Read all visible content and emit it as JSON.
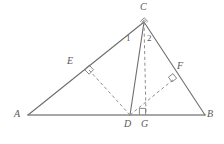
{
  "figure": {
    "kind": "geometry-diagram",
    "canvas": {
      "width": 224,
      "height": 144
    },
    "colors": {
      "stroke": "#6e6e6e",
      "baseline_stroke": "#8a8a8a",
      "dashed_stroke": "#8f8f8f",
      "label_text": "#595959",
      "background": "#ffffff"
    },
    "points": [
      {
        "name": "A",
        "label": "A",
        "x": 28,
        "y": 115,
        "label_x": 14,
        "label_y": 110
      },
      {
        "name": "B",
        "label": "B",
        "x": 205,
        "y": 115,
        "label_x": 207,
        "label_y": 110
      },
      {
        "name": "C",
        "label": "C",
        "x": 144,
        "y": 22,
        "label_x": 140,
        "label_y": 3
      },
      {
        "name": "D",
        "label": "D",
        "x": 130,
        "y": 115,
        "label_x": 124,
        "label_y": 119
      },
      {
        "name": "G",
        "label": "G",
        "x": 146,
        "y": 115,
        "label_x": 141,
        "label_y": 119
      },
      {
        "name": "E",
        "label": "E",
        "x": 89,
        "y": 70,
        "label_x": 67,
        "label_y": 56
      },
      {
        "name": "F",
        "label": "F",
        "x": 174,
        "y": 79,
        "label_x": 177,
        "label_y": 62
      }
    ],
    "solid_segments": [
      {
        "name": "segment-AB",
        "from": "A",
        "to": "B",
        "style": "baseline"
      },
      {
        "name": "segment-AC",
        "from": "A",
        "to": "C",
        "style": "normal"
      },
      {
        "name": "segment-CB",
        "from": "C",
        "to": "B",
        "style": "normal"
      },
      {
        "name": "segment-CD",
        "from": "C",
        "to": "D",
        "style": "normal"
      }
    ],
    "dashed_segments": [
      {
        "name": "segment-CG",
        "from": "C",
        "to": "G"
      },
      {
        "name": "segment-DE",
        "from": "D",
        "to": "E"
      },
      {
        "name": "segment-DF",
        "from": "D",
        "to": "F"
      }
    ],
    "right_angle_marks": [
      {
        "name": "right-angle-at-E",
        "at": "E",
        "size": 6
      },
      {
        "name": "right-angle-at-F",
        "at": "F",
        "size": 6
      },
      {
        "name": "right-angle-at-G",
        "at": "G",
        "size": 6
      },
      {
        "name": "right-angle-at-C",
        "at": "C",
        "size": 5
      }
    ],
    "angle_labels": [
      {
        "name": "angle-1",
        "text": "1",
        "x": 126,
        "y": 36
      },
      {
        "name": "angle-2",
        "text": "2",
        "x": 147,
        "y": 36
      }
    ]
  }
}
